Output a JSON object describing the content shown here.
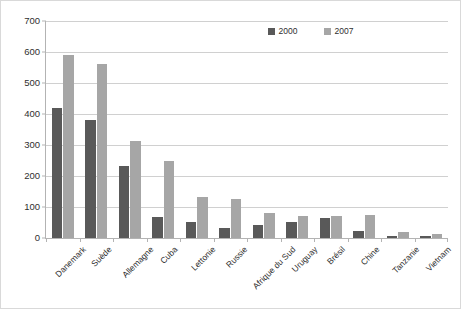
{
  "chart_data": {
    "type": "bar",
    "title": "",
    "subtitle": "",
    "xlabel": "",
    "ylabel": "",
    "ylim": [
      0,
      700
    ],
    "ytick_step": 100,
    "yticks": [
      0,
      100,
      200,
      300,
      400,
      500,
      600,
      700
    ],
    "grid": true,
    "legend_position": "top-right",
    "categories": [
      "Danemark",
      "Suède",
      "Allemagne",
      "Cuba",
      "Lettonie",
      "Russie",
      "Afrique du Sud",
      "Uruguay",
      "Brésil",
      "Chine",
      "Tanzanie",
      "Vietnam"
    ],
    "series": [
      {
        "name": "2000",
        "color": "#595959",
        "values": [
          420,
          380,
          232,
          68,
          52,
          33,
          42,
          53,
          64,
          24,
          5,
          8
        ]
      },
      {
        "name": "2007",
        "color": "#a6a6a6",
        "values": [
          590,
          560,
          312,
          250,
          133,
          125,
          80,
          72,
          72,
          75,
          18,
          13
        ]
      }
    ]
  },
  "legend": {
    "entries": [
      {
        "label": "2000",
        "color": "#595959"
      },
      {
        "label": "2007",
        "color": "#a6a6a6"
      }
    ]
  },
  "colors": {
    "series_2000": "#595959",
    "series_2007": "#a6a6a6",
    "axis": "#b3b3b3",
    "gridline": "#d0d0d0",
    "text": "#2f2f2f",
    "border": "#d9d9d9",
    "background": "#ffffff"
  }
}
